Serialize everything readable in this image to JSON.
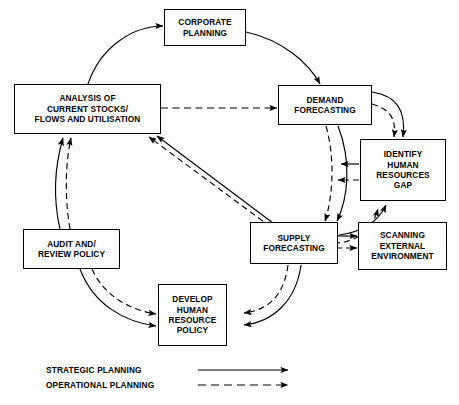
{
  "diagram": {
    "type": "cycle-flow-diagram",
    "stroke_color": "#000000",
    "background_color": "#ffffff",
    "nodes": [
      {
        "id": "corporate-planning",
        "label": "CORPORATE\nPLANNING"
      },
      {
        "id": "analysis-current-stocks",
        "label": "ANALYSIS OF\nCURRENT STOCKS/\nFLOWS AND UTILISATION"
      },
      {
        "id": "demand-forecasting",
        "label": "DEMAND\nFORECASTING"
      },
      {
        "id": "identify-hr-gap",
        "label": "IDENTIFY\nHUMAN\nRESOURCES\nGAP"
      },
      {
        "id": "supply-forecasting",
        "label": "SUPPLY\nFORECASTING"
      },
      {
        "id": "scanning-external-environment",
        "label": "SCANNING\nEXTERNAL\nENVIRONMENT"
      },
      {
        "id": "audit-review-policy",
        "label": "AUDIT AND/\nREVIEW POLICY"
      },
      {
        "id": "develop-hr-policy",
        "label": "DEVELOP\nHUMAN\nRESOURCE\nPOLICY"
      }
    ],
    "legend": [
      {
        "id": "strategic-planning",
        "label": "STRATEGIC PLANNING",
        "line_style": "solid"
      },
      {
        "id": "operational-planning",
        "label": "OPERATIONAL PLANNING",
        "line_style": "dashed"
      }
    ],
    "edges": [
      {
        "from": "analysis-current-stocks",
        "to": "corporate-planning",
        "style": "solid"
      },
      {
        "from": "corporate-planning",
        "to": "demand-forecasting",
        "style": "solid"
      },
      {
        "from": "analysis-current-stocks",
        "to": "demand-forecasting",
        "style": "dashed"
      },
      {
        "from": "demand-forecasting",
        "to": "identify-hr-gap",
        "style": "solid"
      },
      {
        "from": "demand-forecasting",
        "to": "identify-hr-gap",
        "style": "dashed"
      },
      {
        "from": "demand-forecasting",
        "to": "supply-forecasting",
        "style": "solid"
      },
      {
        "from": "demand-forecasting",
        "to": "supply-forecasting",
        "style": "dashed"
      },
      {
        "from": "identify-hr-gap",
        "to": "supply-forecasting",
        "style": "solid"
      },
      {
        "from": "identify-hr-gap",
        "to": "supply-forecasting",
        "style": "dashed"
      },
      {
        "from": "supply-forecasting",
        "to": "identify-hr-gap",
        "style": "solid"
      },
      {
        "from": "supply-forecasting",
        "to": "identify-hr-gap",
        "style": "dashed"
      },
      {
        "from": "supply-forecasting",
        "to": "scanning-external-environment",
        "style": "solid"
      },
      {
        "from": "supply-forecasting",
        "to": "scanning-external-environment",
        "style": "dashed"
      },
      {
        "from": "supply-forecasting",
        "to": "analysis-current-stocks",
        "style": "solid"
      },
      {
        "from": "supply-forecasting",
        "to": "analysis-current-stocks",
        "style": "dashed"
      },
      {
        "from": "supply-forecasting",
        "to": "develop-hr-policy",
        "style": "solid"
      },
      {
        "from": "supply-forecasting",
        "to": "develop-hr-policy",
        "style": "dashed"
      },
      {
        "from": "audit-review-policy",
        "to": "analysis-current-stocks",
        "style": "solid"
      },
      {
        "from": "audit-review-policy",
        "to": "analysis-current-stocks",
        "style": "dashed"
      },
      {
        "from": "audit-review-policy",
        "to": "develop-hr-policy",
        "style": "solid"
      },
      {
        "from": "audit-review-policy",
        "to": "develop-hr-policy",
        "style": "dashed"
      }
    ]
  }
}
